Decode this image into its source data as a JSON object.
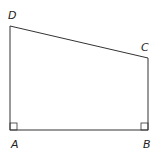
{
  "diagram": {
    "shape": "right trapezoid",
    "stroke_color": "#333333",
    "background": "#ffffff",
    "vertices": [
      {
        "label": "A",
        "x": 10,
        "y": 130
      },
      {
        "label": "B",
        "x": 148,
        "y": 130
      },
      {
        "label": "C",
        "x": 148,
        "y": 58
      },
      {
        "label": "D",
        "x": 10,
        "y": 26
      }
    ],
    "labels": {
      "A": "A",
      "B": "B",
      "C": "C",
      "D": "D"
    },
    "right_angles": [
      "A",
      "B"
    ]
  }
}
